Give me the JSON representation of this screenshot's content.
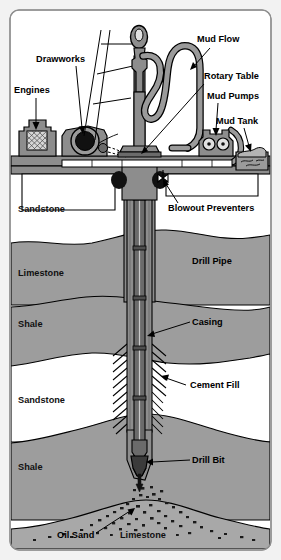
{
  "figure": {
    "background_color": "#f2f2f2",
    "panel_color": "#ffffff",
    "border_color": "#9a9a9a"
  },
  "colors": {
    "metal_gray": "#8d8d8d",
    "metal_dark": "#6b6b6b",
    "rock_gray": "#9d9d9d",
    "rock_gray_dark": "#8f8f8f",
    "rock_white": "#ffffff",
    "oil_sand": "#a8a8a8",
    "outline": "#000000",
    "label_text": "#000000"
  },
  "labels": {
    "engines": "Engines",
    "drawworks": "Drawworks",
    "mud_flow": "Mud Flow",
    "rotary_table": "Rotary Table",
    "mud_pumps": "Mud Pumps",
    "mud_tank": "Mud Tank",
    "blowout_preventers": "Blowout Preventers",
    "drill_pipe": "Drill Pipe",
    "casing": "Casing",
    "cement_fill": "Cement Fill",
    "drill_bit": "Drill Bit",
    "oil_sand": "Oil Sand"
  },
  "strata": [
    {
      "name": "Sandstone",
      "fill": "#ffffff",
      "top": 175,
      "bottom": 240
    },
    {
      "name": "Limestone",
      "fill": "#9d9d9d",
      "top": 240,
      "bottom": 302
    },
    {
      "name": "Shale",
      "fill": "#9d9d9d",
      "top": 302,
      "bottom": 360
    },
    {
      "name": "Sandstone",
      "fill": "#ffffff",
      "top": 360,
      "bottom": 432
    },
    {
      "name": "Shale",
      "fill": "#9d9d9d",
      "top": 432,
      "bottom": 505
    },
    {
      "name": "Limestone",
      "fill": "#a8a8a8",
      "top": 505,
      "bottom": 545
    }
  ],
  "strata_labels": [
    {
      "text": "Sandstone",
      "x": 18,
      "y": 212
    },
    {
      "text": "Limestone",
      "x": 18,
      "y": 276
    },
    {
      "text": "Shale",
      "x": 18,
      "y": 327
    },
    {
      "text": "Sandstone",
      "x": 18,
      "y": 403
    },
    {
      "text": "Shale",
      "x": 18,
      "y": 470
    },
    {
      "text": "Limestone",
      "x": 120,
      "y": 538
    }
  ],
  "callouts": [
    {
      "key": "engines",
      "text": "Engines",
      "x": 14,
      "y": 93
    },
    {
      "key": "drawworks",
      "text": "Drawworks",
      "x": 36,
      "y": 62
    },
    {
      "key": "mud_flow",
      "text": "Mud Flow",
      "x": 197,
      "y": 42
    },
    {
      "key": "rotary_table",
      "text": "Rotary Table",
      "x": 204,
      "y": 79
    },
    {
      "key": "mud_pumps",
      "text": "Mud Pumps",
      "x": 207,
      "y": 99
    },
    {
      "key": "mud_tank",
      "text": "Mud Tank",
      "x": 216,
      "y": 124
    },
    {
      "key": "blowout_preventers",
      "text": "Blowout Preventers",
      "x": 168,
      "y": 211
    },
    {
      "key": "drill_pipe",
      "text": "Drill Pipe",
      "x": 192,
      "y": 264
    },
    {
      "key": "casing",
      "text": "Casing",
      "x": 192,
      "y": 325
    },
    {
      "key": "cement_fill",
      "text": "Cement Fill",
      "x": 190,
      "y": 388
    },
    {
      "key": "drill_bit",
      "text": "Drill Bit",
      "x": 192,
      "y": 463
    },
    {
      "key": "oil_sand",
      "text": "Oil Sand",
      "x": 57,
      "y": 538
    }
  ]
}
